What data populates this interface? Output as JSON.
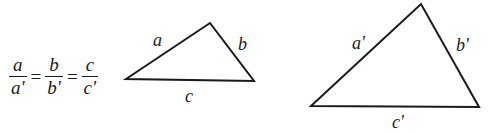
{
  "equation": {
    "fractions": [
      {
        "num": "a",
        "den": "a'"
      },
      {
        "num": "b",
        "den": "b'"
      },
      {
        "num": "c",
        "den": "c'"
      }
    ],
    "operator": "="
  },
  "triangles": [
    {
      "name": "small",
      "vertices": [
        [
          126,
          79
        ],
        [
          210,
          23
        ],
        [
          254,
          81
        ]
      ],
      "labels": {
        "a": "a",
        "b": "b",
        "c": "c"
      }
    },
    {
      "name": "large",
      "vertices": [
        [
          311,
          106
        ],
        [
          421,
          4
        ],
        [
          479,
          107
        ]
      ],
      "labels": {
        "a": "a'",
        "b": "b'",
        "c": "c'"
      }
    }
  ],
  "colors": {
    "stroke": "#1a1a1a",
    "background": "#ffffff"
  }
}
